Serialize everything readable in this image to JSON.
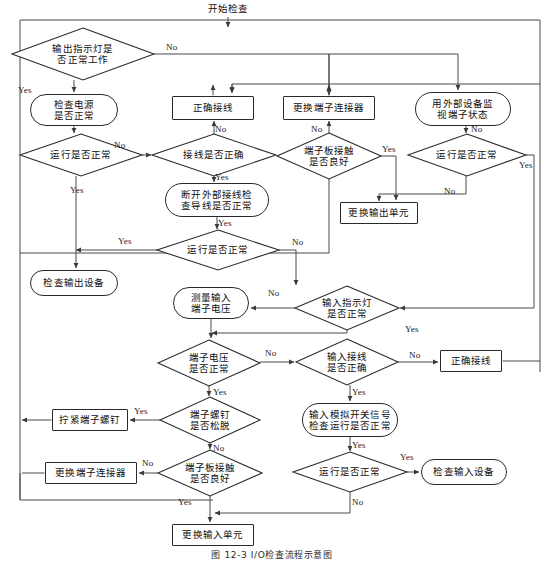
{
  "figure": {
    "caption": "图 12-3   I/O检查流程示意图",
    "caption_top": 548
  },
  "nodes": [
    {
      "id": "start",
      "name": "node-start-inspection",
      "shape": "plain",
      "text": "开始检查",
      "x": 188,
      "y": 2,
      "w": 80,
      "h": 14
    },
    {
      "id": "d_out_led",
      "name": "decision-output-indicator",
      "shape": "decision",
      "text": "输出指示灯是\n否正常工作",
      "x": 12,
      "y": 28,
      "w": 142,
      "h": 52
    },
    {
      "id": "p_check_power",
      "name": "process-check-power",
      "shape": "terminal",
      "text": "检查电源\n是否正常",
      "x": 30,
      "y": 94,
      "w": 88,
      "h": 32
    },
    {
      "id": "p_correct_wire1",
      "name": "process-correct-wiring-output",
      "shape": "process",
      "text": "正确接线",
      "x": 172,
      "y": 96,
      "w": 82,
      "h": 24
    },
    {
      "id": "p_repl_conn1",
      "name": "process-replace-terminal-connector-output",
      "shape": "process",
      "text": "更换端子连接器",
      "x": 283,
      "y": 96,
      "w": 92,
      "h": 24
    },
    {
      "id": "p_monitor_ext",
      "name": "process-monitor-terminal-external",
      "shape": "terminal",
      "text": "用外部设备监\n视端子状态",
      "x": 415,
      "y": 92,
      "w": 96,
      "h": 34
    },
    {
      "id": "d_run_ok1",
      "name": "decision-run-normal-1",
      "shape": "decision",
      "text": "运行是否正常",
      "x": 20,
      "y": 134,
      "w": 122,
      "h": 42
    },
    {
      "id": "d_wire_ok1",
      "name": "decision-wiring-correct-output",
      "shape": "decision",
      "text": "接线是否正确",
      "x": 152,
      "y": 134,
      "w": 124,
      "h": 42
    },
    {
      "id": "d_tb_contact1",
      "name": "decision-terminal-board-contact-output",
      "shape": "decision",
      "text": "端子板接触\n是否良好",
      "x": 277,
      "y": 133,
      "w": 104,
      "h": 46
    },
    {
      "id": "d_run_ok2",
      "name": "decision-run-normal-2",
      "shape": "decision",
      "text": "运行是否正常",
      "x": 408,
      "y": 134,
      "w": 118,
      "h": 42
    },
    {
      "id": "p_disconnect",
      "name": "process-disconnect-ext-wiring",
      "shape": "terminal",
      "text": "断开外部接线检\n查导线是否正常",
      "x": 165,
      "y": 183,
      "w": 104,
      "h": 34
    },
    {
      "id": "p_repl_out_unit",
      "name": "process-replace-output-unit",
      "shape": "process",
      "text": "更换输出单元",
      "x": 340,
      "y": 202,
      "w": 78,
      "h": 22
    },
    {
      "id": "d_run_ok3",
      "name": "decision-run-normal-3",
      "shape": "decision",
      "text": "运行是否正常",
      "x": 157,
      "y": 230,
      "w": 122,
      "h": 40
    },
    {
      "id": "p_check_out_dev",
      "name": "process-check-output-device",
      "shape": "terminal",
      "text": "检查输出设备",
      "x": 30,
      "y": 270,
      "w": 88,
      "h": 26
    },
    {
      "id": "p_meas_volt",
      "name": "process-measure-input-voltage",
      "shape": "terminal",
      "text": "测量输入\n端子电压",
      "x": 173,
      "y": 287,
      "w": 76,
      "h": 32
    },
    {
      "id": "d_in_led",
      "name": "decision-input-indicator",
      "shape": "decision",
      "text": "输入指示灯\n是否正常",
      "x": 295,
      "y": 286,
      "w": 104,
      "h": 44
    },
    {
      "id": "d_term_volt",
      "name": "decision-terminal-voltage",
      "shape": "decision",
      "text": "端子电压\n是否正常",
      "x": 158,
      "y": 340,
      "w": 102,
      "h": 46
    },
    {
      "id": "d_in_wire",
      "name": "decision-input-wiring-correct",
      "shape": "decision",
      "text": "输入接线\n是否正确",
      "x": 296,
      "y": 339,
      "w": 102,
      "h": 46
    },
    {
      "id": "p_correct_wire2",
      "name": "process-correct-wiring-input",
      "shape": "process",
      "text": "正确接线",
      "x": 440,
      "y": 350,
      "w": 62,
      "h": 22
    },
    {
      "id": "p_tighten_screw",
      "name": "process-tighten-terminal-screw",
      "shape": "process",
      "text": "拧紧端子螺钉",
      "x": 52,
      "y": 409,
      "w": 76,
      "h": 22
    },
    {
      "id": "d_screw_loose",
      "name": "decision-terminal-screw-loose",
      "shape": "decision",
      "text": "端子螺钉\n是否松脱",
      "x": 160,
      "y": 397,
      "w": 100,
      "h": 46
    },
    {
      "id": "p_sim_signal",
      "name": "process-simulate-switch-signal",
      "shape": "terminal",
      "text": "输入模拟开关信号\n检查运行是否正常",
      "x": 302,
      "y": 403,
      "w": 96,
      "h": 34
    },
    {
      "id": "p_repl_conn2",
      "name": "process-replace-terminal-connector-input",
      "shape": "process",
      "text": "更换端子连接器",
      "x": 45,
      "y": 462,
      "w": 92,
      "h": 22
    },
    {
      "id": "d_tb_contact2",
      "name": "decision-terminal-board-contact-input",
      "shape": "decision",
      "text": "端子板接触\n是否良好",
      "x": 158,
      "y": 450,
      "w": 104,
      "h": 46
    },
    {
      "id": "d_run_ok4",
      "name": "decision-run-normal-4",
      "shape": "decision",
      "text": "运行是否正常",
      "x": 293,
      "y": 452,
      "w": 114,
      "h": 40
    },
    {
      "id": "p_check_in_dev",
      "name": "process-check-input-device",
      "shape": "terminal",
      "text": "检查输入设备",
      "x": 421,
      "y": 459,
      "w": 86,
      "h": 26
    },
    {
      "id": "p_repl_in_unit",
      "name": "process-replace-input-unit",
      "shape": "process",
      "text": "更换输入单元",
      "x": 172,
      "y": 524,
      "w": 82,
      "h": 22
    }
  ],
  "edge_labels": [
    {
      "name": "edge-label-no-output-led",
      "text": "No",
      "x": 166,
      "y": 42
    },
    {
      "name": "edge-label-yes-output-led",
      "text": "Yes",
      "x": 18,
      "y": 85
    },
    {
      "name": "edge-label-no-run1",
      "text": "No",
      "x": 114,
      "y": 140
    },
    {
      "name": "edge-label-no-wire1",
      "text": "No",
      "x": 215,
      "y": 124
    },
    {
      "name": "edge-label-yes-wire1",
      "text": "Yes",
      "x": 215,
      "y": 172
    },
    {
      "name": "edge-label-no-tb-contact1",
      "text": "No",
      "x": 311,
      "y": 124
    },
    {
      "name": "edge-label-yes-tb-contact1",
      "text": "Yes",
      "x": 382,
      "y": 144
    },
    {
      "name": "edge-label-no-monitor-ext",
      "text": "No",
      "x": 471,
      "y": 124
    },
    {
      "name": "edge-label-yes-run2",
      "text": "Yes",
      "x": 519,
      "y": 160
    },
    {
      "name": "edge-label-no-run2",
      "text": "No",
      "x": 444,
      "y": 186
    },
    {
      "name": "edge-label-yes-disconnect",
      "text": "Yes",
      "x": 218,
      "y": 218
    },
    {
      "name": "edge-label-yes-run1",
      "text": "Yes",
      "x": 70,
      "y": 185
    },
    {
      "name": "edge-label-yes-run3",
      "text": "Yes",
      "x": 118,
      "y": 236
    },
    {
      "name": "edge-label-no-run3",
      "text": "No",
      "x": 292,
      "y": 237
    },
    {
      "name": "edge-label-no-input-led",
      "text": "No",
      "x": 268,
      "y": 288
    },
    {
      "name": "edge-label-yes-input-led",
      "text": "Yes",
      "x": 405,
      "y": 324
    },
    {
      "name": "edge-label-no-term-volt",
      "text": "No",
      "x": 265,
      "y": 348
    },
    {
      "name": "edge-label-yes-term-volt",
      "text": "Yes",
      "x": 213,
      "y": 387
    },
    {
      "name": "edge-label-no-in-wire",
      "text": "No",
      "x": 409,
      "y": 350
    },
    {
      "name": "edge-label-yes-in-wire",
      "text": "Yes",
      "x": 352,
      "y": 387
    },
    {
      "name": "edge-label-yes-screw",
      "text": "Yes",
      "x": 134,
      "y": 406
    },
    {
      "name": "edge-label-no-screw",
      "text": "No",
      "x": 213,
      "y": 443
    },
    {
      "name": "edge-label-yes-sim-signal",
      "text": "Yes",
      "x": 352,
      "y": 440
    },
    {
      "name": "edge-label-no-tb-contact2",
      "text": "No",
      "x": 142,
      "y": 458
    },
    {
      "name": "edge-label-yes-tb-contact2",
      "text": "Yes",
      "x": 178,
      "y": 497
    },
    {
      "name": "edge-label-yes-run4",
      "text": "Yes",
      "x": 400,
      "y": 452
    },
    {
      "name": "edge-label-no-run4",
      "text": "No",
      "x": 352,
      "y": 497
    }
  ],
  "colors": {
    "line": "#4a4a4a",
    "node_border": "#2a2a2a",
    "text": "#0f0f0f",
    "background": "#ffffff"
  }
}
